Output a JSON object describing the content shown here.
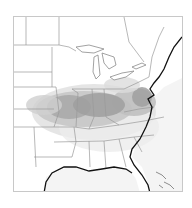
{
  "map": {
    "region": "Eastern United States",
    "style": "grayscale density shading",
    "colors": {
      "background": "#ffffff",
      "ocean": "#f4f4f4",
      "boundary": "#9a9a9a",
      "coastline": "#111111",
      "density_low": "#e2e2e2",
      "density_mid": "#bdbdbd",
      "density_high": "#8f8f8f"
    },
    "hotspot_band": "Central Plains through Ohio Valley to Mid-Atlantic"
  }
}
